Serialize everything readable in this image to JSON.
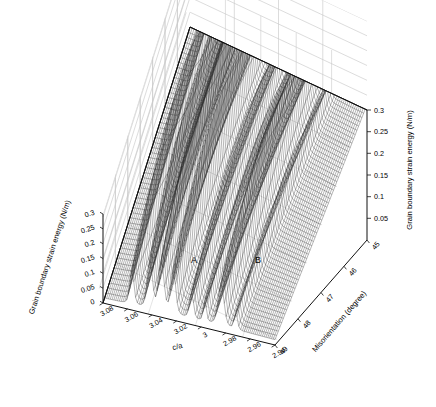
{
  "figure": {
    "type": "3d-surface-mesh-plot",
    "background_color": "#ffffff",
    "line_color": "#1a1a1a",
    "grid_color": "#c9c9c9"
  },
  "chart_data": {
    "type": "surface",
    "title": "",
    "subtitle": "",
    "projection": "3d",
    "mesh_style": "wireframe",
    "mesh_color": "#333333",
    "grid": true,
    "legend": null,
    "xlabel": "c/a",
    "ylabel": "Misorientation (degree)",
    "zlabel": "Grain boundary strain energy (N/m)",
    "xlim": [
      2.94,
      3.08
    ],
    "ylim": [
      45,
      49
    ],
    "zlim": [
      0,
      0.3
    ],
    "x_ticks": [
      "3.08",
      "3.06",
      "3.04",
      "3.02",
      "3",
      "2.98",
      "2.96",
      "2.94"
    ],
    "x_tick_values": [
      3.08,
      3.06,
      3.04,
      3.02,
      3.0,
      2.98,
      2.96,
      2.94
    ],
    "y_ticks": [
      "49",
      "48",
      "47",
      "46",
      "45"
    ],
    "y_tick_values": [
      49,
      48,
      47,
      46,
      45
    ],
    "z_ticks_left": [
      "0",
      "0.05",
      "0.1",
      "0.15",
      "0.2",
      "0.25",
      "0.3"
    ],
    "z_ticks_right": [
      "0.05",
      "0.1",
      "0.15",
      "0.2",
      "0.25",
      "0.3"
    ],
    "z_tick_values": [
      0,
      0.05,
      0.1,
      0.15,
      0.2,
      0.25,
      0.3
    ],
    "annotations": [
      {
        "label": "A",
        "x": 3.02,
        "y": 46.9,
        "z": 0.055
      },
      {
        "label": "B",
        "x": 2.975,
        "y": 46.9,
        "z": 0.055
      }
    ],
    "ridge_peaks_z": [
      0.23,
      0.3,
      0.3,
      0.28,
      0.21,
      0.25
    ],
    "baseline_z": 0.03
  },
  "axes": {
    "z_left": {
      "title": "Grain boundary strain energy (N/m)",
      "ticks": [
        "0",
        "0.05",
        "0.1",
        "0.15",
        "0.2",
        "0.25",
        "0.3"
      ]
    },
    "z_right": {
      "title": "Grain boundary strain energy (N/m)",
      "ticks": [
        "0.05",
        "0.1",
        "0.15",
        "0.2",
        "0.25",
        "0.3"
      ]
    },
    "x": {
      "title": "c/a",
      "ticks": [
        "3.08",
        "3.06",
        "3.04",
        "3.02",
        "3",
        "2.98",
        "2.96",
        "2.94"
      ]
    },
    "y": {
      "title": "Misorientation (degree)",
      "ticks": [
        "49",
        "48",
        "47",
        "46",
        "45"
      ]
    }
  },
  "markers": {
    "a": "A",
    "b": "B"
  }
}
